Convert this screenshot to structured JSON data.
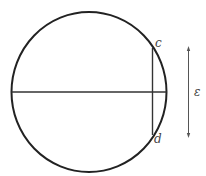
{
  "diagram": {
    "labels": {
      "c": "c",
      "d": "d",
      "epsilon": "ε"
    },
    "colors": {
      "circle": "#222222",
      "chord": "#333333",
      "arrow": "#555555",
      "text": "#444444"
    }
  }
}
